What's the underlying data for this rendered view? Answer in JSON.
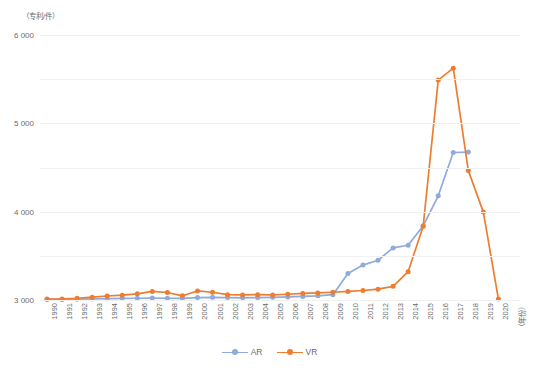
{
  "chart_data": {
    "type": "line",
    "title": "",
    "subtitle": "",
    "xlabel": "（年份）",
    "ylabel": "（专利/件）",
    "ylim": [
      0,
      6000
    ],
    "ytick_values": [
      6000,
      5000,
      4000,
      3000,
      2000,
      1000,
      0
    ],
    "ytick_labels": [
      "6 000",
      "5 000",
      "4 000",
      "3 000",
      "2 000",
      "1 000",
      "0"
    ],
    "grid": true,
    "legend_position": "bottom-center",
    "categories": [
      "1990",
      "1991",
      "1992",
      "1993",
      "1994",
      "1995",
      "1996",
      "1997",
      "1998",
      "1999",
      "2000",
      "2001",
      "2002",
      "2003",
      "2004",
      "2005",
      "2006",
      "2007",
      "2008",
      "2009",
      "2010",
      "2011",
      "2012",
      "2013",
      "2014",
      "2015",
      "2016",
      "2017",
      "2018",
      "2019",
      "2020"
    ],
    "series": [
      {
        "name": "AR",
        "color": "#8FAADC",
        "marker": "circle",
        "values": [
          10,
          12,
          18,
          25,
          30,
          35,
          40,
          45,
          40,
          38,
          55,
          60,
          55,
          50,
          55,
          60,
          70,
          80,
          95,
          120,
          600,
          790,
          900,
          1180,
          1240,
          1680,
          2360,
          3340,
          3350,
          null,
          null
        ]
      },
      {
        "name": "VR",
        "color": "#ED7D31",
        "marker": "circle",
        "values": [
          20,
          25,
          40,
          65,
          90,
          110,
          140,
          195,
          170,
          95,
          205,
          175,
          120,
          115,
          120,
          115,
          130,
          150,
          160,
          175,
          195,
          215,
          245,
          310,
          640,
          1670,
          4980,
          5250,
          2930,
          1990,
          20
        ]
      }
    ],
    "annotations": []
  },
  "legend": {
    "items": [
      {
        "label": "AR",
        "color": "#8FAADC"
      },
      {
        "label": "VR",
        "color": "#ED7D31"
      }
    ]
  },
  "colors": {
    "ar": "#8FAADC",
    "vr": "#ED7D31",
    "grid": "#f0f0f0",
    "text": "#6b6b6b",
    "background": "#ffffff"
  }
}
